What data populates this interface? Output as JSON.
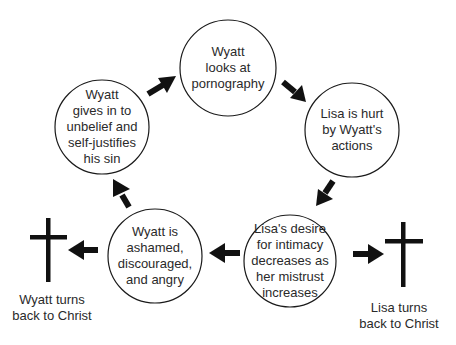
{
  "diagram": {
    "type": "cycle",
    "colors": {
      "stroke": "#1a1a1a",
      "text": "#2a2a2a",
      "background": "#ffffff"
    },
    "nodes": [
      {
        "id": "n1",
        "text": "Wyatt\nlooks at\npornography"
      },
      {
        "id": "n2",
        "text": "Lisa is hurt\nby Wyatt's\nactions"
      },
      {
        "id": "n3",
        "text": "Lisa's desire\nfor intimacy\ndecreases as\nher mistrust\nincreases"
      },
      {
        "id": "n4",
        "text": "Wyatt is\nashamed,\ndiscouraged,\nand angry"
      },
      {
        "id": "n5",
        "text": "Wyatt\ngives in to\nunbelief and\nself-justifies\nhis sin"
      }
    ],
    "edges": [
      {
        "from": "n1",
        "to": "n2"
      },
      {
        "from": "n2",
        "to": "n3"
      },
      {
        "from": "n3",
        "to": "n4"
      },
      {
        "from": "n4",
        "to": "n5"
      },
      {
        "from": "n5",
        "to": "n1"
      },
      {
        "from": "n4",
        "to": "wyatt-cross"
      },
      {
        "from": "n3",
        "to": "lisa-cross"
      }
    ],
    "exits": [
      {
        "id": "wyatt-cross",
        "icon": "cross-icon",
        "label": "Wyatt turns\nback to Christ"
      },
      {
        "id": "lisa-cross",
        "icon": "cross-icon",
        "label": "Lisa turns\nback to Christ"
      }
    ]
  }
}
